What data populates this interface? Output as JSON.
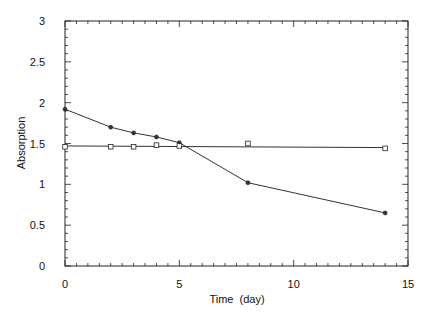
{
  "chart_data": {
    "type": "line",
    "title": "",
    "xlabel": "Time  (day)",
    "ylabel": "Absorption",
    "xlim": [
      0,
      15
    ],
    "ylim": [
      0,
      3
    ],
    "xticks": [
      "0",
      "5",
      "10",
      "15"
    ],
    "yticks": [
      "0",
      "0.5",
      "1",
      "1.5",
      "2",
      "2.5",
      "3"
    ],
    "grid": false,
    "legend": null,
    "series": [
      {
        "name": "filled-circle series",
        "marker": "circle-filled",
        "line": "connected",
        "x": [
          0,
          2,
          3,
          4,
          5,
          8,
          14
        ],
        "y": [
          1.92,
          1.7,
          1.63,
          1.58,
          1.51,
          1.02,
          0.65
        ]
      },
      {
        "name": "open-square series",
        "marker": "square-open",
        "line": "linear-fit",
        "x": [
          0,
          2,
          3,
          4,
          5,
          8,
          14
        ],
        "y": [
          1.46,
          1.46,
          1.46,
          1.48,
          1.47,
          1.5,
          1.44
        ],
        "fit_line": {
          "x": [
            0,
            14
          ],
          "y": [
            1.47,
            1.45
          ]
        }
      }
    ]
  }
}
